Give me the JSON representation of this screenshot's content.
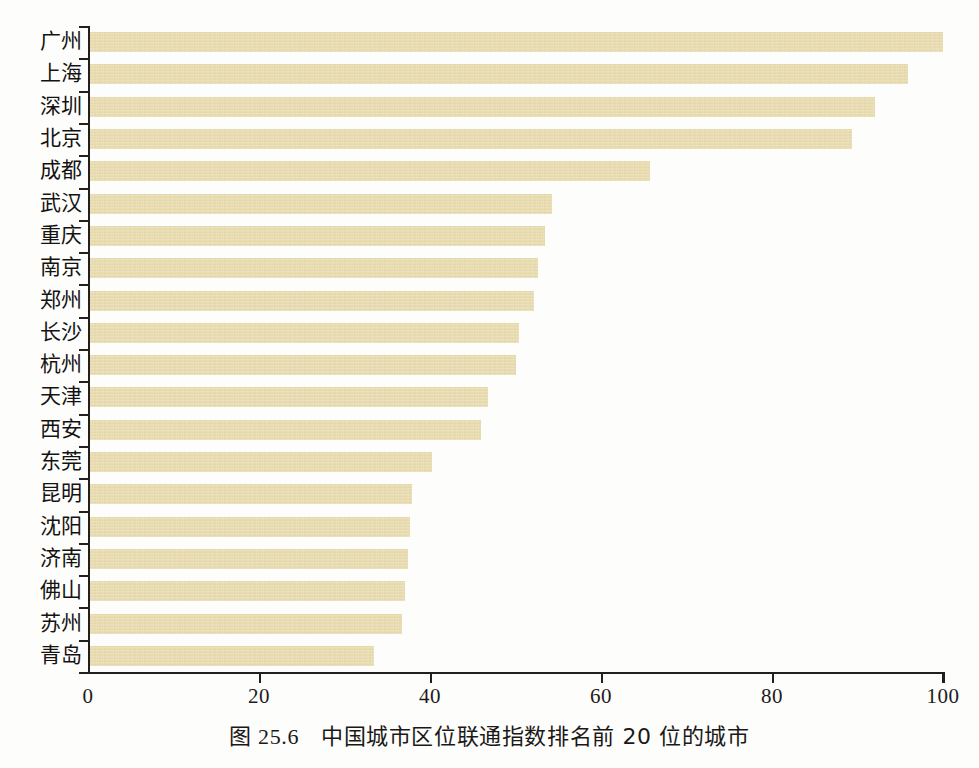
{
  "caption": {
    "figure_number": "图 25.6",
    "text": "中国城市区位联通指数排名前 20 位的城市"
  },
  "axis": {
    "x_ticks": [
      "0",
      "20",
      "40",
      "60",
      "80",
      "100"
    ],
    "x_min": 0,
    "x_max": 100
  },
  "chart_data": {
    "type": "bar",
    "orientation": "horizontal",
    "xlabel": "",
    "ylabel": "",
    "xlim": [
      0,
      100
    ],
    "xticks": [
      0,
      20,
      40,
      60,
      80,
      100
    ],
    "grid": false,
    "legend": false,
    "bar_color": "#e9dcae",
    "categories": [
      "广州",
      "上海",
      "深圳",
      "北京",
      "成都",
      "武汉",
      "重庆",
      "南京",
      "郑州",
      "长沙",
      "杭州",
      "天津",
      "西安",
      "东莞",
      "昆明",
      "沈阳",
      "济南",
      "佛山",
      "苏州",
      "青岛"
    ],
    "values": [
      100.0,
      95.9,
      92.0,
      89.3,
      65.7,
      54.3,
      53.5,
      52.6,
      52.2,
      50.4,
      50.1,
      46.8,
      46.0,
      40.2,
      37.9,
      37.7,
      37.4,
      37.1,
      36.7,
      33.5
    ]
  }
}
